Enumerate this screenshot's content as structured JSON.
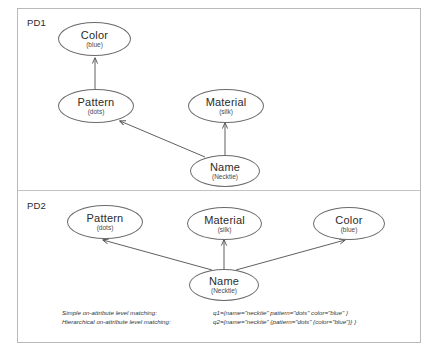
{
  "diagram": {
    "title_labels": {
      "pd1": "PD1",
      "pd2": "PD2"
    },
    "pd1": {
      "nodes": [
        {
          "id": "color",
          "title": "Color",
          "sub": "(blue)"
        },
        {
          "id": "pattern",
          "title": "Pattern",
          "sub": "(dots)"
        },
        {
          "id": "material",
          "title": "Material",
          "sub": "(silk)"
        },
        {
          "id": "name",
          "title": "Name",
          "sub": "(Necktie)"
        }
      ],
      "edges": [
        {
          "from": "pattern",
          "to": "color"
        },
        {
          "from": "name",
          "to": "pattern"
        },
        {
          "from": "name",
          "to": "material"
        }
      ]
    },
    "pd2": {
      "nodes": [
        {
          "id": "pattern",
          "title": "Pattern",
          "sub": "(dots)"
        },
        {
          "id": "material",
          "title": "Material",
          "sub": "(silk)"
        },
        {
          "id": "color",
          "title": "Color",
          "sub": "(blue)"
        },
        {
          "id": "name",
          "title": "Name",
          "sub": "(Necktie)"
        }
      ],
      "edges": [
        {
          "from": "name",
          "to": "pattern"
        },
        {
          "from": "name",
          "to": "material"
        },
        {
          "from": "name",
          "to": "color"
        }
      ]
    },
    "legend": {
      "row1_label": "Simple on-attribute level matching:",
      "row1_value": "q1={name=\"necktie\" pattern=\"dots\" color=\"blue\" }",
      "row2_label": "Hierarchical on-attribute level matching:",
      "row2_value": "q2={name=\"necktie\" {pattern=\"dots\" {color=\"blue\"}} }"
    },
    "colors": {
      "node_stroke": "#6b6b6b",
      "edge_stroke": "#4d4d4d",
      "frame": "#b9b9b9",
      "text": "#2b2b2b"
    }
  }
}
